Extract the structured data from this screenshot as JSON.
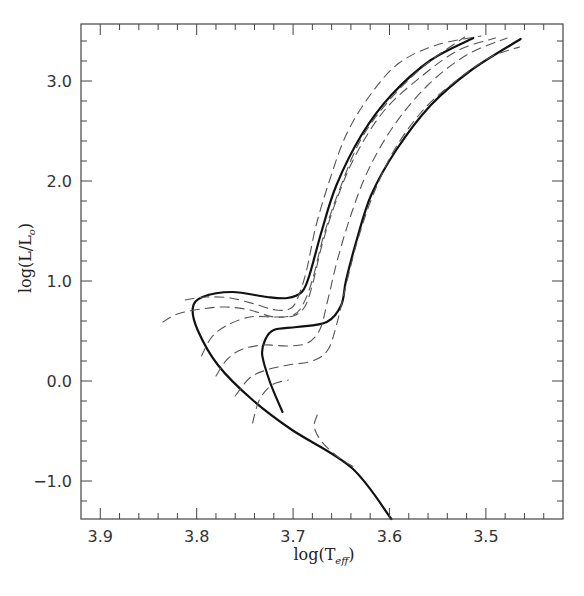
{
  "chart_data": {
    "type": "line",
    "title": "",
    "xlabel": "log(T_eff)",
    "xlabel_main": "log(T",
    "xlabel_sub": "eff",
    "xlabel_close": ")",
    "ylabel": "log(L/L☉)",
    "ylabel_main": "log(L/L",
    "ylabel_sub": "o",
    "ylabel_close": ")",
    "xlim": [
      3.92,
      3.42
    ],
    "ylim": [
      -1.38,
      3.57
    ],
    "x_reversed": true,
    "grid": false,
    "legend": null,
    "x_ticks": [
      {
        "value": 3.9,
        "label": "3.9"
      },
      {
        "value": 3.8,
        "label": "3.8"
      },
      {
        "value": 3.7,
        "label": "3.7"
      },
      {
        "value": 3.6,
        "label": "3.6"
      },
      {
        "value": 3.5,
        "label": "3.5"
      }
    ],
    "y_ticks": [
      {
        "value": 3.0,
        "label": "3.0"
      },
      {
        "value": 2.0,
        "label": "2.0"
      },
      {
        "value": 1.0,
        "label": "1.0"
      },
      {
        "value": 0.0,
        "label": "0.0"
      },
      {
        "value": -1.0,
        "label": "−1.0"
      }
    ],
    "series": [
      {
        "name": "track-thick-1",
        "style": "solid-thick",
        "x": [
          3.598,
          3.639,
          3.701,
          3.742,
          3.778,
          3.799,
          3.804,
          3.794,
          3.763,
          3.727,
          3.706,
          3.691,
          3.683,
          3.67,
          3.655,
          3.629,
          3.598,
          3.557,
          3.513
        ],
        "y": [
          -1.38,
          -0.87,
          -0.49,
          -0.19,
          0.16,
          0.51,
          0.73,
          0.84,
          0.89,
          0.84,
          0.83,
          0.89,
          1.06,
          1.51,
          1.96,
          2.46,
          2.86,
          3.21,
          3.43
        ]
      },
      {
        "name": "track-thick-2",
        "style": "solid-thick",
        "x": [
          3.711,
          3.724,
          3.732,
          3.729,
          3.72,
          3.696,
          3.665,
          3.65,
          3.645,
          3.634,
          3.619,
          3.593,
          3.557,
          3.515,
          3.464
        ],
        "y": [
          -0.31,
          -0.01,
          0.26,
          0.41,
          0.51,
          0.54,
          0.59,
          0.76,
          1.01,
          1.41,
          1.86,
          2.31,
          2.76,
          3.11,
          3.42
        ]
      },
      {
        "name": "track-dashed-outer-left",
        "style": "dashed",
        "x": [
          3.835,
          3.82,
          3.795,
          3.77,
          3.745,
          3.72,
          3.7,
          3.69,
          3.68,
          3.668,
          3.652,
          3.63,
          3.6,
          3.563,
          3.522
        ],
        "y": [
          0.59,
          0.67,
          0.72,
          0.74,
          0.71,
          0.64,
          0.66,
          0.76,
          1.01,
          1.46,
          1.91,
          2.41,
          2.81,
          3.16,
          3.44
        ]
      },
      {
        "name": "track-dashed-top",
        "style": "dashed",
        "x": [
          3.812,
          3.79,
          3.765,
          3.74,
          3.718,
          3.702,
          3.694,
          3.686,
          3.676,
          3.662,
          3.645,
          3.62,
          3.59,
          3.551,
          3.505
        ],
        "y": [
          0.81,
          0.84,
          0.83,
          0.77,
          0.71,
          0.73,
          0.86,
          1.11,
          1.56,
          2.01,
          2.46,
          2.86,
          3.18,
          3.36,
          3.45
        ]
      },
      {
        "name": "track-dashed-mid",
        "style": "dashed",
        "x": [
          3.795,
          3.785,
          3.77,
          3.745,
          3.72,
          3.7,
          3.688,
          3.68,
          3.67,
          3.655,
          3.635,
          3.605,
          3.565,
          3.528,
          3.49
        ],
        "y": [
          0.25,
          0.43,
          0.55,
          0.64,
          0.64,
          0.65,
          0.74,
          0.96,
          1.36,
          1.81,
          2.26,
          2.71,
          3.06,
          3.31,
          3.43
        ]
      },
      {
        "name": "track-dashed-inner",
        "style": "dashed",
        "x": [
          3.78,
          3.768,
          3.752,
          3.73,
          3.705,
          3.685,
          3.672,
          3.664,
          3.654,
          3.64,
          3.622,
          3.595,
          3.56,
          3.52,
          3.478
        ],
        "y": [
          0.05,
          0.22,
          0.32,
          0.36,
          0.35,
          0.38,
          0.52,
          0.81,
          1.21,
          1.66,
          2.11,
          2.56,
          2.96,
          3.26,
          3.43
        ]
      },
      {
        "name": "track-dashed-right",
        "style": "dashed",
        "x": [
          3.76,
          3.745,
          3.728,
          3.705,
          3.68,
          3.664,
          3.655,
          3.645,
          3.633,
          3.617,
          3.595,
          3.565,
          3.53,
          3.495,
          3.465
        ],
        "y": [
          -0.15,
          0.03,
          0.11,
          0.16,
          0.2,
          0.31,
          0.56,
          0.96,
          1.41,
          1.86,
          2.31,
          2.71,
          3.01,
          3.24,
          3.34
        ]
      },
      {
        "name": "track-dashed-low",
        "style": "dashed",
        "x": [
          3.742,
          3.735,
          3.722,
          3.705
        ],
        "y": [
          -0.42,
          -0.19,
          -0.04,
          0.01
        ]
      },
      {
        "name": "track-dashed-ms-segment",
        "style": "dashed",
        "x": [
          3.675,
          3.678,
          3.67,
          3.652,
          3.635
        ],
        "y": [
          -0.34,
          -0.46,
          -0.61,
          -0.77,
          -0.87
        ]
      }
    ]
  }
}
